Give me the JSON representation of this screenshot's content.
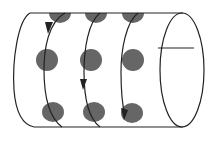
{
  "diagram": {
    "title": "",
    "colors": {
      "background": "#ffffff",
      "stroke": "#222222",
      "dot": "#666666"
    },
    "cylinder": {
      "top_y": 13,
      "bottom_y": 127,
      "left_x": 30,
      "end_cap": {
        "cx": 182,
        "cy": 70,
        "rx": 23,
        "ry": 57
      },
      "cap_line_y": 48
    },
    "dot_rows": [
      {
        "y": 13,
        "xs": [
          60,
          96,
          133
        ],
        "partial": true
      },
      {
        "y": 60,
        "xs": [
          47,
          91,
          133
        ],
        "partial": false
      },
      {
        "y": 112,
        "xs": [
          53,
          94,
          132
        ],
        "partial": false
      }
    ],
    "arrows": [
      {
        "x": 50,
        "y": 32,
        "direction": "down"
      },
      {
        "x": 83,
        "y": 83,
        "direction": "down"
      },
      {
        "x": 127,
        "y": 112,
        "direction": "down-left"
      }
    ]
  }
}
